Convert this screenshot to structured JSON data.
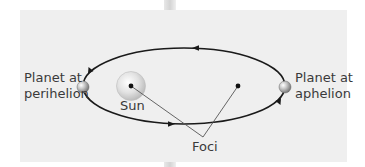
{
  "diagram": {
    "labels": {
      "perihelion_line1": "Planet at",
      "perihelion_line2": "perihelion",
      "aphelion_line1": "Planet at",
      "aphelion_line2": "aphelion",
      "sun": "Sun",
      "foci": "Foci"
    },
    "colors": {
      "panel_background": "#efefef",
      "orbit_line": "#1a1a1a",
      "pointer_line": "#555555",
      "sun_fill": "#d6d6d6",
      "planet_fill": "#9a9a9a",
      "text": "#3a3a3a"
    },
    "orbit": {
      "center_x": 184,
      "center_y": 86,
      "radius_x": 101,
      "radius_y": 38,
      "direction": "counterclockwise-arrows"
    },
    "foci_points": [
      {
        "name": "sun-focus",
        "x": 131,
        "y": 86
      },
      {
        "name": "empty-focus",
        "x": 238,
        "y": 86
      }
    ],
    "foci_pointer_target": {
      "x": 203,
      "y": 137
    }
  }
}
